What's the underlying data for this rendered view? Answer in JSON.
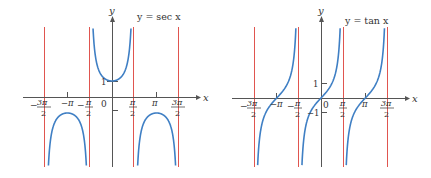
{
  "colors": {
    "curve": "#3f7fc4",
    "asymptote": "#e0554f",
    "axis": "#555555",
    "text": "#333333"
  },
  "chart_data": [
    {
      "type": "line",
      "title": "y = sec x",
      "function": "sec",
      "xlabel": "x",
      "ylabel": "y",
      "x_tick_labels": [
        "-3π/2",
        "-π",
        "-π/2",
        "0",
        "π/2",
        "π",
        "3π/2"
      ],
      "y_tick_labels": [
        "1",
        "-1"
      ],
      "vertical_asymptotes": [
        "-3π/2",
        "-π/2",
        "π/2",
        "3π/2"
      ],
      "xlim": [
        -4.9,
        4.8
      ],
      "ylim": [
        -4.4,
        5
      ],
      "grid": false,
      "legend": "none",
      "sample_points": [
        {
          "x": "-π",
          "y": -1
        },
        {
          "x": "0",
          "y": 1
        },
        {
          "x": "π",
          "y": -1
        }
      ],
      "origin_px": [
        112,
        97
      ],
      "px_per_unit_x": 14.2,
      "px_per_unit_y": 16,
      "x_range_px": [
        23,
        198
      ],
      "y_range_px": [
        18,
        167
      ],
      "title_px": [
        137,
        18
      ]
    },
    {
      "type": "line",
      "title": "y = tan x",
      "function": "tan",
      "xlabel": "x",
      "ylabel": "y",
      "x_tick_labels": [
        "-3π/2",
        "-π",
        "-π/2",
        "0",
        "π/2",
        "π",
        "3π/2"
      ],
      "y_tick_labels": [
        "1",
        "-1"
      ],
      "vertical_asymptotes": [
        "-3π/2",
        "-π/2",
        "π/2",
        "3π/2"
      ],
      "xlim": [
        -5.6,
        5.7
      ],
      "ylim": [
        -4.6,
        5.3
      ],
      "grid": false,
      "legend": "none",
      "sample_points": [
        {
          "x": "-π",
          "y": 0
        },
        {
          "x": "0",
          "y": 0
        },
        {
          "x": "π",
          "y": 0
        },
        {
          "x": "π/4",
          "y": 1
        },
        {
          "x": "-π/4",
          "y": -1
        }
      ],
      "origin_px": [
        321,
        98
      ],
      "px_per_unit_x": 14.1,
      "px_per_unit_y": 15,
      "x_range_px": [
        232,
        408
      ],
      "y_range_px": [
        18,
        167
      ],
      "title_px": [
        345,
        22
      ]
    }
  ],
  "charts": {
    "sec": {
      "title": "y = sec x",
      "y_label": "y",
      "x_label": "x",
      "ticks": {
        "neg_3pi_2_num": "3π",
        "neg_pi": "−π",
        "neg_pi_2_num": "π",
        "zero": "0",
        "pi_2_num": "π",
        "pi": "π",
        "three_pi_2_num": "3π",
        "den": "2",
        "minus": "−",
        "one": "1"
      }
    },
    "tan": {
      "title": "y = tan x",
      "y_label": "y",
      "x_label": "x",
      "ticks": {
        "neg_3pi_2_num": "3π",
        "neg_pi": "−π",
        "neg_pi_2_num": "π",
        "zero": "0",
        "pi_2_num": "π",
        "pi": "π",
        "three_pi_2_num": "3π",
        "den": "2",
        "minus": "−",
        "one": "1",
        "neg_one": "−1"
      }
    }
  }
}
